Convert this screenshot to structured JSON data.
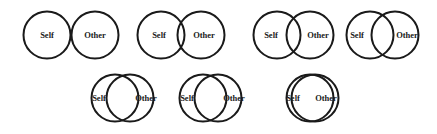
{
  "diagram": {
    "background": "#ffffff",
    "stroke_color": "#1a1a1a",
    "radius": 23.5,
    "left_label": "Self",
    "right_label": "Other",
    "items": [
      {
        "index": 1,
        "self_cx": 47,
        "other_cx": 95,
        "cy": 35,
        "self_label_x": 47,
        "other_label_x": 95
      },
      {
        "index": 2,
        "self_cx": 161,
        "other_cx": 201,
        "cy": 35,
        "self_label_x": 159,
        "other_label_x": 204
      },
      {
        "index": 3,
        "self_cx": 277,
        "other_cx": 310,
        "cy": 35,
        "self_label_x": 271,
        "other_label_x": 318
      },
      {
        "index": 4,
        "self_cx": 370,
        "other_cx": 395,
        "cy": 35,
        "self_label_x": 357,
        "other_label_x": 407
      },
      {
        "index": 5,
        "self_cx": 115,
        "other_cx": 130,
        "cy": 98,
        "self_label_x": 99,
        "other_label_x": 146
      },
      {
        "index": 6,
        "self_cx": 203,
        "other_cx": 218,
        "cy": 98,
        "self_label_x": 187,
        "other_label_x": 234
      },
      {
        "index": 7,
        "self_cx": 310,
        "other_cx": 315,
        "cy": 98,
        "self_label_x": 293,
        "other_label_x": 326
      }
    ]
  }
}
